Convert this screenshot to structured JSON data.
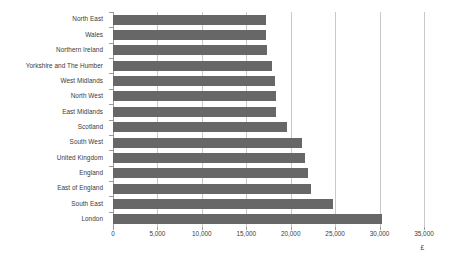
{
  "chart_data": {
    "type": "bar",
    "orientation": "horizontal",
    "title": "",
    "subtitle": "",
    "xlabel": "£",
    "ylabel": "",
    "xlim": [
      0,
      35000
    ],
    "grid": true,
    "legend": null,
    "bar_color": "#676767",
    "gridline_color": "#c9c9c9",
    "axis_color": "#9a9a9a",
    "xticks": [
      0,
      5000,
      10000,
      15000,
      20000,
      25000,
      30000,
      35000
    ],
    "xtick_labels": [
      "0",
      "5,000",
      "10,000",
      "15,000",
      "20,000",
      "25,000",
      "30,000",
      "35,000"
    ],
    "categories": [
      "North East",
      "Wales",
      "Northern Ireland",
      "Yorkshire and The Humber",
      "West Midlands",
      "North West",
      "East Midlands",
      "Scotland",
      "South West",
      "United Kingdom",
      "England",
      "East of England",
      "South East",
      "London"
    ],
    "values": [
      17200,
      17200,
      17300,
      17900,
      18200,
      18300,
      18400,
      19600,
      21300,
      21600,
      22000,
      22300,
      24800,
      30300
    ]
  }
}
